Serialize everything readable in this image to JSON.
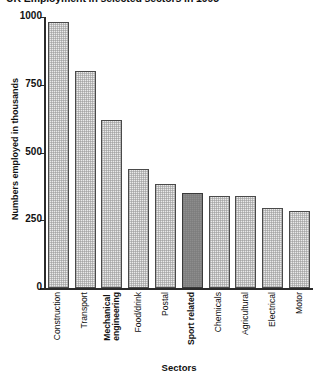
{
  "chart_data": {
    "type": "bar",
    "title": "UK Employment in selected sectors in 1995",
    "xlabel": "Sectors",
    "ylabel": "Numbers employed in thousands",
    "ylim": [
      0,
      1000
    ],
    "yticks": [
      0,
      250,
      500,
      750,
      1000
    ],
    "ytick_labels": [
      "0",
      "250",
      "500",
      "750",
      "1000"
    ],
    "grid": false,
    "legend": "none",
    "categories": [
      "Construction",
      "Transport",
      "Mechanical engineering",
      "Food/drink",
      "Postal",
      "Sport related",
      "Chemicals",
      "Agricultural",
      "Electrical",
      "Motor"
    ],
    "category_lines": [
      [
        "Construction"
      ],
      [
        "Transport"
      ],
      [
        "Mechanical",
        "engineering"
      ],
      [
        "Food/drink"
      ],
      [
        "Postal"
      ],
      [
        "Sport related"
      ],
      [
        "Chemicals"
      ],
      [
        "Agricultural"
      ],
      [
        "Electrical"
      ],
      [
        "Motor"
      ]
    ],
    "category_emphasis": [
      false,
      false,
      true,
      false,
      false,
      true,
      false,
      false,
      false,
      false
    ],
    "values": [
      980,
      800,
      620,
      440,
      385,
      350,
      340,
      340,
      295,
      285
    ],
    "bar_styles": [
      "hatched",
      "hatched",
      "hatched",
      "hatched",
      "hatched",
      "solid-dark",
      "hatched",
      "hatched",
      "hatched",
      "hatched"
    ],
    "highlight_index": 5,
    "colors": {
      "bar_fill": "#eaeaea",
      "bar_highlight_fill": "#8d8d8d",
      "bar_edge": "#4a4a4a",
      "axis": "#2b2b2b",
      "text": "#111111"
    }
  }
}
